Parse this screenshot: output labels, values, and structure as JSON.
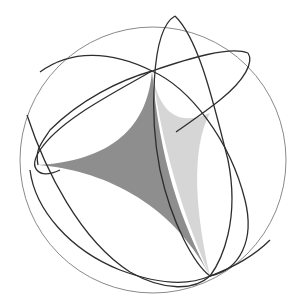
{
  "figure": {
    "type": "spherical-triangle-diagram",
    "caption_fragment": "",
    "colors": {
      "sphere_outline": "#8a8a8a",
      "great_circles": "#2e2e2e",
      "triangle_fill_dark": "#8e8e8e",
      "triangle_fill_light": "#d6d6d6",
      "background": "#ffffff"
    },
    "sphere": {
      "cx": 153,
      "cy": 160,
      "r": 133
    },
    "vertices": {
      "top": [
        152,
        71
      ],
      "left": [
        38,
        165
      ],
      "bottom": [
        210,
        276
      ]
    }
  }
}
